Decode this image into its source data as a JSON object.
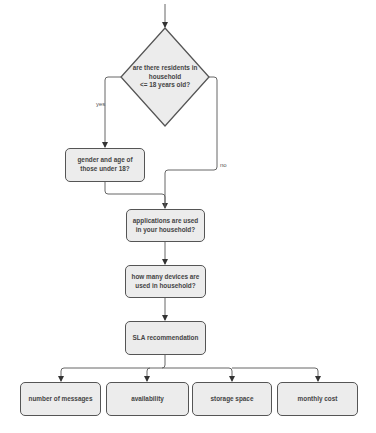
{
  "diagram": {
    "type": "flowchart",
    "colors": {
      "node_fill": "#ececec",
      "node_stroke": "#555555",
      "edge": "#666666",
      "text": "#444444"
    },
    "decision": {
      "id": "q_minors",
      "label_line1": "are there residents in",
      "label_line2": "household",
      "label_line3": "<= 18 years old?"
    },
    "nodes": {
      "gender_age": "gender and age of those under 18?",
      "applications": "applications are used in your household?",
      "devices": "how many devices are used in household?",
      "sla": "SLA recommendation",
      "messages": "number of messages",
      "availability": "availability",
      "storage": "storage space",
      "cost": "monthly cost"
    },
    "edge_labels": {
      "yes": "yes",
      "no": "no"
    },
    "edges": [
      {
        "from": "start",
        "to": "q_minors"
      },
      {
        "from": "q_minors",
        "to": "gender_age",
        "label": "yes"
      },
      {
        "from": "q_minors",
        "to": "applications",
        "label": "no"
      },
      {
        "from": "gender_age",
        "to": "applications"
      },
      {
        "from": "applications",
        "to": "devices"
      },
      {
        "from": "devices",
        "to": "sla"
      },
      {
        "from": "sla",
        "to": "messages"
      },
      {
        "from": "sla",
        "to": "availability"
      },
      {
        "from": "sla",
        "to": "storage"
      },
      {
        "from": "sla",
        "to": "cost"
      }
    ]
  }
}
